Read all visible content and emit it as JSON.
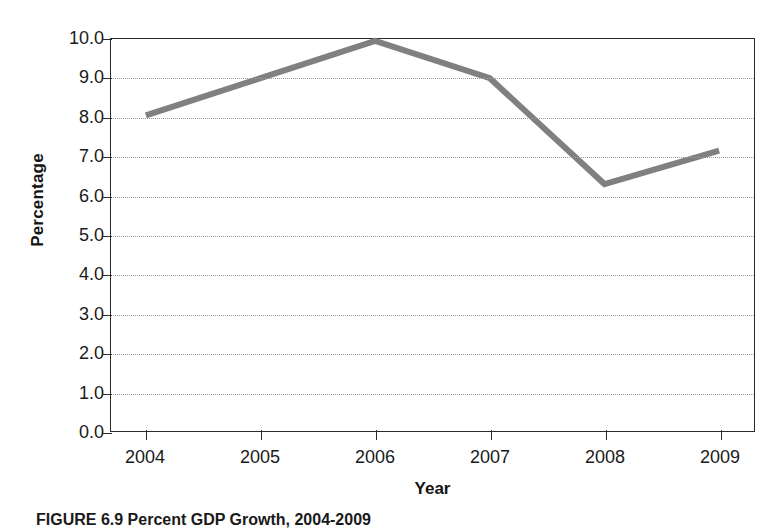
{
  "figure": {
    "caption_label": "FIGURE 6.9",
    "caption_text": "Percent GDP Growth, 2004-2009"
  },
  "chart_data": {
    "type": "line",
    "title": "",
    "xlabel": "Year",
    "ylabel": "Percentage",
    "categories": [
      "2004",
      "2005",
      "2006",
      "2007",
      "2008",
      "2009"
    ],
    "values": [
      8.05,
      9.0,
      9.95,
      9.0,
      6.3,
      7.15
    ],
    "series": [
      {
        "name": "Percent GDP Growth",
        "values": [
          8.05,
          9.0,
          9.95,
          9.0,
          6.3,
          7.15
        ],
        "color": "#808080"
      }
    ],
    "ylim": [
      0.0,
      10.0
    ],
    "ytick_labels": [
      "10.0",
      "9.0",
      "8.0",
      "7.0",
      "6.0",
      "5.0",
      "4.0",
      "3.0",
      "2.0",
      "1.0",
      "0.0"
    ],
    "ytick_values": [
      10.0,
      9.0,
      8.0,
      7.0,
      6.0,
      5.0,
      4.0,
      3.0,
      2.0,
      1.0,
      0.0
    ],
    "xtick_labels": [
      "2004",
      "2005",
      "2006",
      "2007",
      "2008",
      "2009"
    ],
    "grid": true,
    "grid_style": "dotted-horizontal",
    "grid_color": "#9a9a9a",
    "legend": false,
    "line_color": "#808080",
    "line_width": 6,
    "axis_color": "#2b2b2b"
  }
}
